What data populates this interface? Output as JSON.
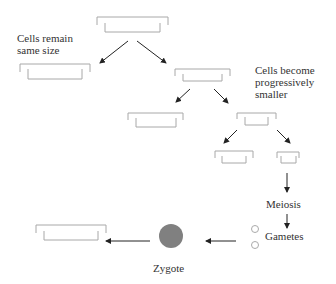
{
  "labels": {
    "cells_remain": "Cells remain\nsame size",
    "cells_become": "Cells become\nprogressively\nsmaller",
    "meiosis": "Meiosis",
    "gametes": "Gametes",
    "zygote": "Zygote"
  },
  "colors": {
    "bracket": "#a8a8a8",
    "arrow": "#222222",
    "zygote": "#808080",
    "gamete": "#aaaaaa"
  }
}
